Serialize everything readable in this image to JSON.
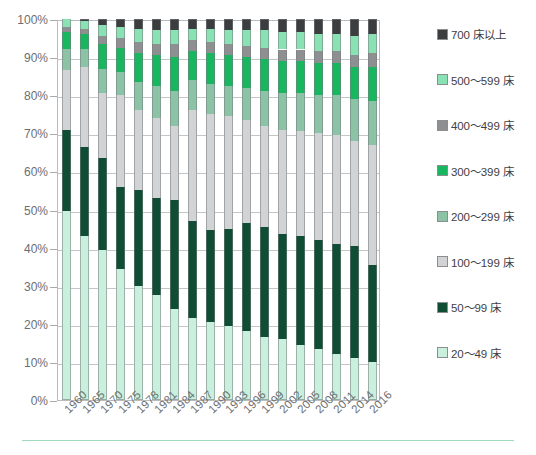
{
  "chart_data": {
    "type": "bar",
    "subtype": "stacked-percentage",
    "title": "",
    "xlabel": "",
    "ylabel": "",
    "ylim": [
      0,
      100
    ],
    "yunit": "%",
    "grid": true,
    "legend_position": "right",
    "ytick_labels": [
      "100%",
      "90%",
      "80%",
      "70%",
      "60%",
      "50%",
      "40%",
      "30%",
      "20%",
      "10%",
      "0%"
    ],
    "ytick_values": [
      100,
      90,
      80,
      70,
      60,
      50,
      40,
      30,
      20,
      10,
      0
    ],
    "categories": [
      "1960",
      "1965",
      "1970",
      "1975",
      "1978",
      "1981",
      "1984",
      "1987",
      "1990",
      "1993",
      "1996",
      "1999",
      "2002",
      "2005",
      "2008",
      "2011",
      "2014",
      "2016"
    ],
    "series": [
      {
        "name": "20～49 床",
        "color": "#c8f0dc",
        "values": [
          49.5,
          43.0,
          39.5,
          34.5,
          30.0,
          27.5,
          24.0,
          21.5,
          20.5,
          19.5,
          18.0,
          16.5,
          16.0,
          14.5,
          13.5,
          12.0,
          11.0,
          10.0
        ]
      },
      {
        "name": "50～99 床",
        "color": "#0f4d34",
        "values": [
          21.5,
          23.5,
          24.0,
          21.5,
          25.0,
          25.5,
          28.5,
          25.5,
          24.0,
          25.5,
          28.5,
          29.0,
          27.5,
          28.5,
          28.5,
          29.0,
          29.5,
          25.5
        ]
      },
      {
        "name": "100～199 床",
        "color": "#d2d3d4",
        "values": [
          15.5,
          21.0,
          17.0,
          24.0,
          21.0,
          21.0,
          19.5,
          29.0,
          30.5,
          29.5,
          27.0,
          26.5,
          27.5,
          27.5,
          28.0,
          28.5,
          27.5,
          31.5
        ]
      },
      {
        "name": "200～299 床",
        "color": "#8cc2a6",
        "values": [
          5.5,
          4.5,
          6.5,
          6.0,
          7.5,
          8.5,
          9.0,
          8.0,
          8.0,
          8.0,
          8.5,
          9.0,
          9.5,
          10.0,
          10.0,
          10.5,
          11.0,
          11.5
        ]
      },
      {
        "name": "300～399 床",
        "color": "#17b65f",
        "values": [
          4.5,
          4.0,
          6.5,
          6.5,
          7.5,
          8.0,
          9.0,
          7.5,
          8.0,
          8.0,
          8.0,
          8.5,
          8.5,
          8.5,
          8.5,
          8.5,
          8.5,
          9.0
        ]
      },
      {
        "name": "400～499 床",
        "color": "#8d8f91",
        "values": [
          1.5,
          1.5,
          2.0,
          2.5,
          3.0,
          3.0,
          3.5,
          3.0,
          3.0,
          3.0,
          3.0,
          3.0,
          3.0,
          3.0,
          3.0,
          3.0,
          3.0,
          3.5
        ]
      },
      {
        "name": "500～599 床",
        "color": "#8ae2b4",
        "values": [
          2.0,
          2.0,
          3.0,
          3.0,
          3.5,
          3.5,
          3.5,
          3.0,
          3.5,
          3.5,
          4.0,
          4.5,
          4.5,
          4.5,
          4.5,
          4.5,
          5.0,
          5.0
        ]
      },
      {
        "name": "700 床以上",
        "color": "#3b3d3f",
        "values": [
          0.0,
          0.5,
          1.5,
          2.0,
          2.5,
          3.0,
          3.0,
          2.5,
          2.5,
          3.0,
          3.0,
          3.0,
          3.5,
          3.5,
          4.0,
          4.0,
          4.5,
          4.0
        ]
      }
    ]
  },
  "legend": {
    "items": [
      {
        "label": "700 床以上",
        "color": "#3b3d3f"
      },
      {
        "label": "500～599 床",
        "color": "#8ae2b4"
      },
      {
        "label": "400～499 床",
        "color": "#8d8f91"
      },
      {
        "label": "300～399 床",
        "color": "#17b65f"
      },
      {
        "label": "200～299 床",
        "color": "#8cc2a6"
      },
      {
        "label": "100～199 床",
        "color": "#d2d3d4"
      },
      {
        "label": "50～99 床",
        "color": "#0f4d34"
      },
      {
        "label": "20～49 床",
        "color": "#c8f0dc"
      }
    ]
  }
}
